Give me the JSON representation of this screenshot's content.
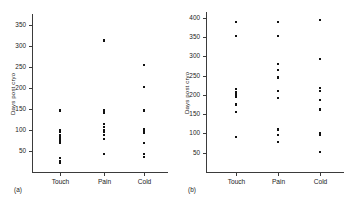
{
  "figure": {
    "background_color": "#ffffff",
    "ink_color": "#111111",
    "axis_color": "#3b3b3b"
  },
  "panels": [
    {
      "tag": "(a)",
      "ylabel": "Days post cryo",
      "ytick_labels": [
        "50",
        "100",
        "150",
        "200",
        "250",
        "300",
        "350"
      ],
      "xtick_labels": [
        "Touch",
        "Pain",
        "Cold"
      ]
    },
    {
      "tag": "(b)",
      "ylabel": "Days post cryo",
      "ytick_labels": [
        "50",
        "100",
        "150",
        "200",
        "250",
        "300",
        "350",
        "400"
      ],
      "xtick_labels": [
        "Touch",
        "Pain",
        "Cold"
      ]
    }
  ],
  "chart_data": [
    {
      "type": "scatter",
      "title": "",
      "panel_tag": "(a)",
      "xlabel": "",
      "ylabel": "Days post cryo",
      "categories": [
        "Touch",
        "Pain",
        "Cold"
      ],
      "ylim": [
        0,
        375
      ],
      "yticks": [
        50,
        100,
        150,
        200,
        250,
        300,
        350
      ],
      "grid": false,
      "legend": "none",
      "series": [
        {
          "name": "Touch",
          "values": [
            146,
            100,
            95,
            88,
            82,
            76,
            70,
            34,
            27,
            22
          ]
        },
        {
          "name": "Pain",
          "values": [
            312,
            146,
            140,
            113,
            106,
            100,
            94,
            88,
            79,
            43
          ]
        },
        {
          "name": "Cold",
          "values": [
            253,
            202,
            146,
            102,
            99,
            96,
            93,
            68,
            42,
            35
          ]
        }
      ]
    },
    {
      "type": "scatter",
      "title": "",
      "panel_tag": "(b)",
      "xlabel": "",
      "ylabel": "Days post cryo",
      "categories": [
        "Touch",
        "Pain",
        "Cold"
      ],
      "ylim": [
        0,
        415
      ],
      "yticks": [
        50,
        100,
        150,
        200,
        250,
        300,
        350,
        400
      ],
      "grid": false,
      "legend": "none",
      "series": [
        {
          "name": "Touch",
          "values": [
            388,
            352,
            215,
            208,
            201,
            194,
            175,
            156,
            91
          ]
        },
        {
          "name": "Pain",
          "values": [
            390,
            352,
            281,
            264,
            245,
            211,
            192,
            110,
            97,
            78
          ]
        },
        {
          "name": "Cold",
          "values": [
            394,
            294,
            218,
            211,
            186,
            162,
            102,
            97,
            52
          ]
        }
      ]
    }
  ]
}
